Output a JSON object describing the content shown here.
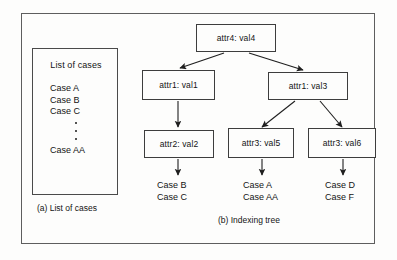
{
  "figure": {
    "caption_a": "(a) List of cases",
    "caption_b": "(b) Indexing tree"
  },
  "list_panel": {
    "title": "List of cases",
    "items": [
      "Case A",
      "Case B",
      "Case C"
    ],
    "ellipsis_dots": 3,
    "last_item": "Case AA"
  },
  "tree": {
    "nodes": [
      {
        "id": "root",
        "label": "attr4: val4"
      },
      {
        "id": "n1",
        "label": "attr1: val1"
      },
      {
        "id": "n2",
        "label": "attr1: val3"
      },
      {
        "id": "n3",
        "label": "attr2: val2"
      },
      {
        "id": "n4",
        "label": "attr3: val5"
      },
      {
        "id": "n5",
        "label": "attr3: val6"
      }
    ],
    "leaves": [
      {
        "id": "l1",
        "line1": "Case B",
        "line2": "Case C"
      },
      {
        "id": "l2",
        "line1": "Case A",
        "line2": "Case AA"
      },
      {
        "id": "l3",
        "line1": "Case D",
        "line2": "Case F"
      }
    ]
  },
  "colors": {
    "ink": "#1f1f1f",
    "border": "#3d3d3d",
    "background": "#fdfdfc"
  }
}
